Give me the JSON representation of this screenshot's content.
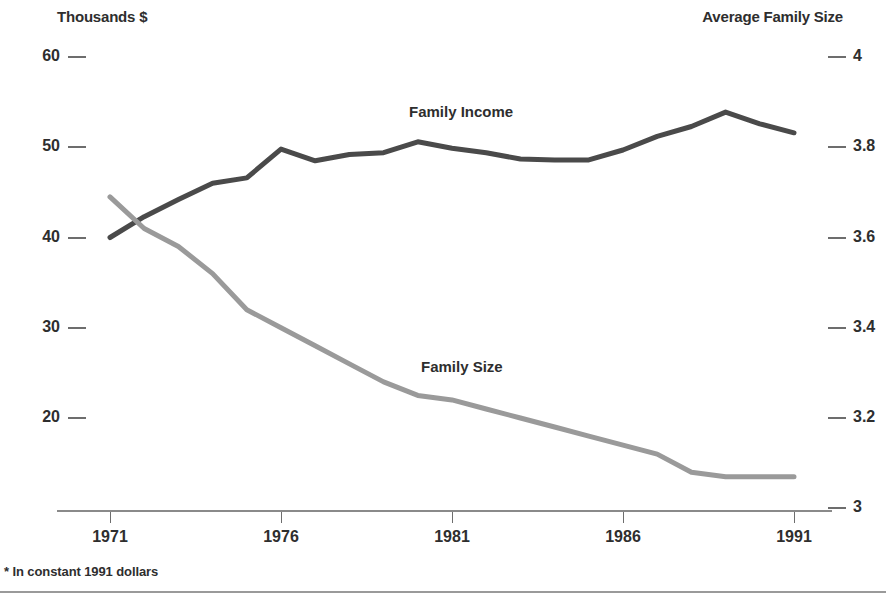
{
  "figure": {
    "footnote": "* In constant 1991 dollars",
    "left_axis_title": "Thousands $",
    "right_axis_title": "Average Family Size"
  },
  "colors": {
    "family_income_line": "#4a4a4a",
    "family_size_line": "#9a9a9a",
    "axis": "#6d6d6d",
    "text": "#2e2e2e",
    "background": "#ffffff"
  },
  "labels": {
    "family_income": "Family Income",
    "family_size": "Family Size"
  },
  "chart_data": {
    "type": "line",
    "title": "",
    "subtitle": "",
    "xlabel": "",
    "ylabel": "Thousands $",
    "y2label": "Average Family Size",
    "grid": false,
    "legend": "inline-annotations",
    "annotations": [
      "Family Income",
      "Family Size"
    ],
    "xlim": [
      1971,
      1991
    ],
    "xticks": [
      1971,
      1976,
      1981,
      1986,
      1991
    ],
    "xtick_labels": [
      "1971",
      "1976",
      "1981",
      "1986",
      "1991"
    ],
    "ylim": [
      15,
      60
    ],
    "yticks": [
      20,
      30,
      40,
      50,
      60
    ],
    "ytick_labels": [
      "20",
      "30",
      "40",
      "50",
      "60"
    ],
    "y2lim": [
      3.0,
      4.0
    ],
    "y2ticks": [
      3,
      3.2,
      3.4,
      3.6,
      3.8,
      4
    ],
    "y2tick_labels": [
      "3",
      "3.2",
      "3.4",
      "3.6",
      "3.8",
      "4"
    ],
    "x": [
      1971,
      1972,
      1973,
      1974,
      1975,
      1976,
      1977,
      1978,
      1979,
      1980,
      1981,
      1982,
      1983,
      1984,
      1985,
      1986,
      1987,
      1988,
      1989,
      1990,
      1991
    ],
    "series": [
      {
        "name": "Family Income",
        "axis": "left",
        "units": "Thousands $",
        "color": "#4a4a4a",
        "values": [
          40.0,
          42.3,
          44.2,
          46.0,
          46.6,
          49.8,
          48.5,
          49.2,
          49.4,
          50.6,
          49.9,
          49.4,
          48.7,
          48.6,
          48.6,
          49.7,
          51.2,
          52.3,
          53.9,
          52.6,
          51.6
        ]
      },
      {
        "name": "Family Size",
        "axis": "right",
        "units": "persons",
        "color": "#9a9a9a",
        "values": [
          3.69,
          3.62,
          3.58,
          3.52,
          3.44,
          3.4,
          3.36,
          3.32,
          3.28,
          3.25,
          3.24,
          3.22,
          3.2,
          3.18,
          3.16,
          3.14,
          3.12,
          3.08,
          3.07,
          3.07,
          3.07
        ]
      }
    ]
  }
}
